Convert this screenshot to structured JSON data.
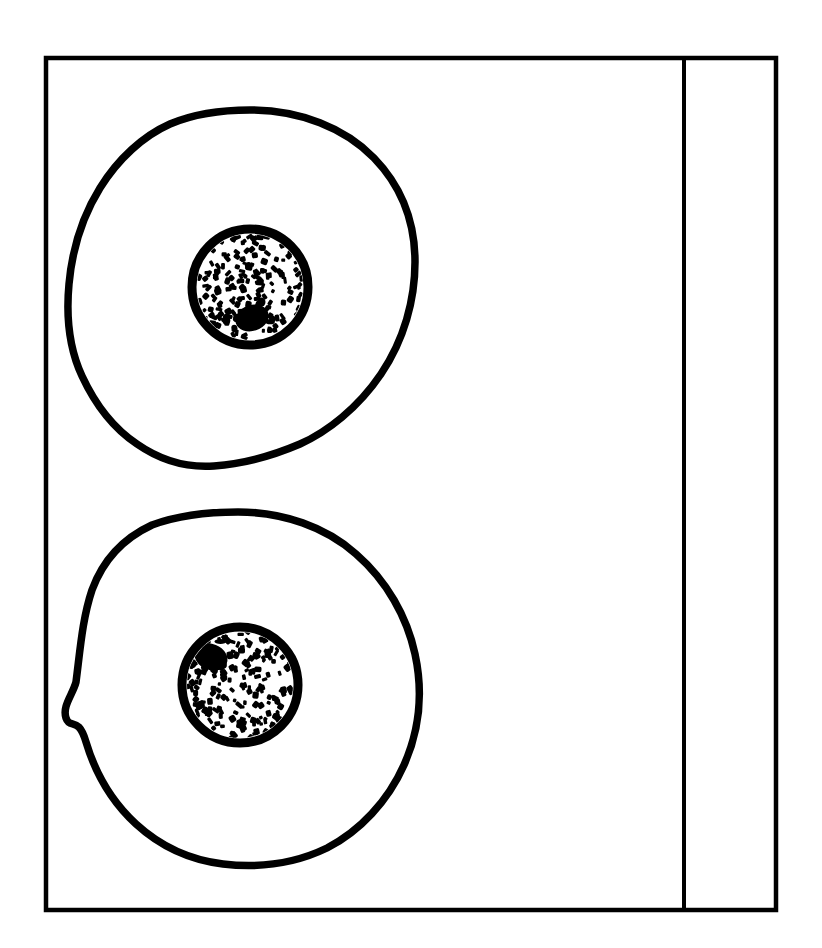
{
  "figure": {
    "title": "Two-cell schematic line drawing",
    "description": "Rectangular bordered panel containing two stylised cells stacked vertically, each drawn as an irregular closed outline enclosing a round stippled nucleus. A narrow empty vertical column is partitioned off at the right edge by a single rule.",
    "background_color": "#ffffff",
    "ink_color": "#000000",
    "canvas": {
      "width": 822,
      "height": 948
    }
  },
  "frame": {
    "name": "outer border rectangle",
    "x": 46,
    "y": 58,
    "width": 730,
    "height": 852,
    "stroke_width": 4.5,
    "color": "#000000"
  },
  "divider": {
    "name": "vertical rule",
    "x": 684,
    "y_top": 58,
    "y_bottom": 910,
    "stroke_width": 4,
    "color": "#000000"
  },
  "right_column": {
    "name": "empty margin column",
    "x": 684,
    "width": 92,
    "content": ""
  },
  "cells": [
    {
      "id": "cell-top",
      "label": "Upper cell",
      "membrane": {
        "label": "Cell membrane outline",
        "stroke_width": 7.5,
        "bbox": {
          "x": 66,
          "y": 108,
          "width": 350,
          "height": 362
        },
        "center": {
          "x": 241,
          "y": 289
        },
        "path": "M 250 110 C 300 110 345 128 374 158 C 404 189 415 226 415 262 C 415 300 404 340 381 374 C 358 408 327 432 300 444 C 272 456 241 464 214 466 C 186 468 160 460 137 444 C 113 428 95 404 82 376 C 69 348 66 316 69 284 C 72 251 82 217 100 188 C 118 159 143 136 170 124 C 196 113 223 110 250 110 Z"
      },
      "nucleus": {
        "label": "Nucleus with stippled chromatin",
        "center": {
          "x": 250,
          "y": 287
        },
        "radius": 58,
        "envelope_stroke_width": 9,
        "speck_count": 175,
        "nucleolus": {
          "label": "Dense chromatin mass",
          "center": {
            "x": 252,
            "y": 318
          },
          "rx": 17,
          "ry": 13,
          "rotation": -18
        }
      }
    },
    {
      "id": "cell-bottom",
      "label": "Lower cell",
      "membrane": {
        "label": "Cell membrane outline",
        "stroke_width": 7.5,
        "bbox": {
          "x": 64,
          "y": 510,
          "width": 358,
          "height": 356
        },
        "center": {
          "x": 240,
          "y": 687
        },
        "path": "M 238 512 C 283 512 326 527 356 554 C 387 581 407 617 415 654 C 423 691 420 729 404 765 C 388 801 360 831 327 848 C 294 864 257 868 223 864 C 190 860 160 846 136 824 C 112 802 95 772 86 742 C 78 715 70 730 66 718 C 62 706 73 694 76 682 C 80 652 82 620 92 590 C 103 560 124 538 152 525 C 179 515 209 512 238 512 Z"
      },
      "nucleus": {
        "label": "Nucleus with stippled chromatin",
        "center": {
          "x": 240,
          "y": 685
        },
        "radius": 58,
        "envelope_stroke_width": 9,
        "speck_count": 175,
        "nucleolus": {
          "label": "Dense chromatin mass",
          "center": {
            "x": 211,
            "y": 657
          },
          "rx": 17,
          "ry": 13,
          "rotation": 22
        }
      }
    }
  ]
}
